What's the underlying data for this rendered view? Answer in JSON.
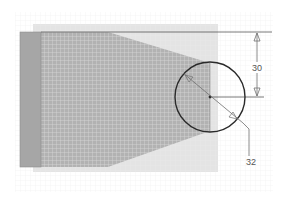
{
  "diagram": {
    "type": "cad-sketch",
    "colors": {
      "background": "#ffffff",
      "grid_fine": "#ececec",
      "panel_light": "#e2e2e2",
      "hatched_fill": "#b4b4b4",
      "hatch_lines": "#d6d6d6",
      "side_bar": "#a6a6a6",
      "outline": "#2a2a2a",
      "dimension_line": "#6e6e6e",
      "dimension_text": "#555555"
    },
    "dimensions": [
      {
        "id": "vertical-distance",
        "label": "30"
      },
      {
        "id": "circle-diameter",
        "label": "32"
      }
    ],
    "shapes": {
      "circle": {
        "cx": 210,
        "cy": 97,
        "r": 35
      }
    }
  }
}
